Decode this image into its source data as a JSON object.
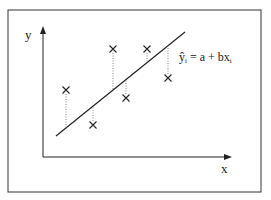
{
  "diagram": {
    "type": "linear-regression-illustration",
    "axes": {
      "x_label": "x",
      "y_label": "y"
    },
    "equation": {
      "hat_y": "ŷ",
      "sub_i": "i",
      "rest": " = a + bx",
      "sub_i2": "i"
    },
    "regression_line": {
      "from": [
        56,
        136
      ],
      "to": [
        185,
        32
      ]
    },
    "points": [
      {
        "x": 66,
        "y": 90,
        "fit_y": 128
      },
      {
        "x": 93,
        "y": 125,
        "fit_y": 106
      },
      {
        "x": 113,
        "y": 49,
        "fit_y": 90
      },
      {
        "x": 126,
        "y": 98,
        "fit_y": 80
      },
      {
        "x": 147,
        "y": 49,
        "fit_y": 63
      },
      {
        "x": 168,
        "y": 78,
        "fit_y": 46
      }
    ],
    "marker": "×",
    "colors": {
      "ink": "#222222",
      "dotted": "#888888",
      "frame": "#333333"
    }
  }
}
